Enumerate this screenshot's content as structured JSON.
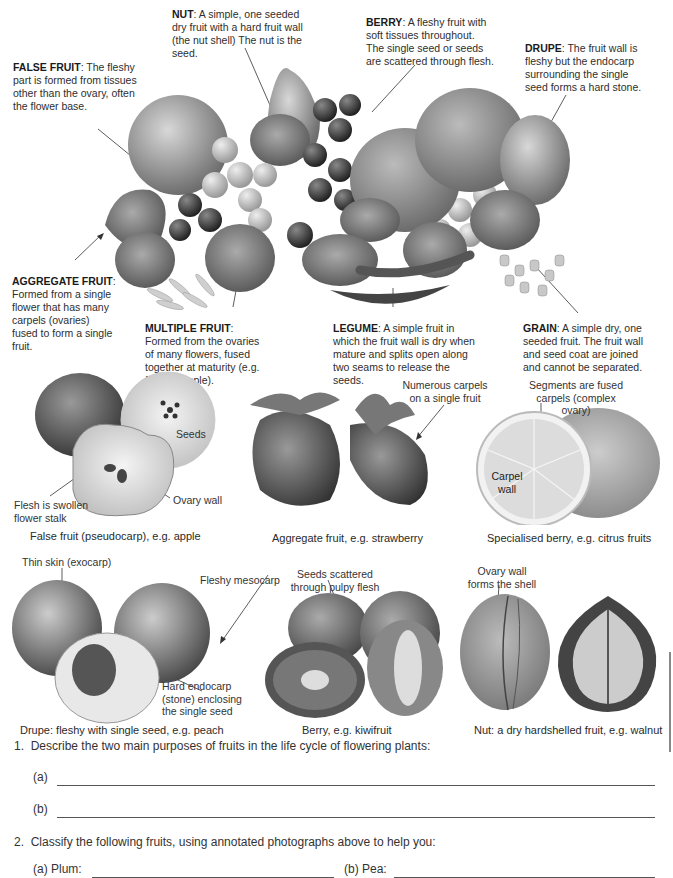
{
  "top_annotations": {
    "false_fruit": {
      "term": "FALSE FRUIT",
      "text": ": The fleshy part is formed from tissues other than the ovary, often the flower base."
    },
    "nut": {
      "term": "NUT",
      "text": ": A simple, one seeded dry fruit with a hard fruit wall (the nut shell) The nut is the seed."
    },
    "berry": {
      "term": "BERRY",
      "text": ": A fleshy fruit with soft tissues throughout. The single seed or seeds are scattered through flesh."
    },
    "drupe": {
      "term": "DRUPE",
      "text": ": The fruit wall is fleshy but the endocarp surrounding the single seed forms a hard stone."
    },
    "aggregate_fruit": {
      "term": "AGGREGATE FRUIT",
      "text": ": Formed from a single flower that has many carpels (ovaries) fused to form a single fruit."
    },
    "multiple_fruit": {
      "term": "MULTIPLE FRUIT",
      "text": ": Formed from the ovaries of many flowers, fused together at maturity (e.g. fig, pineapple)."
    },
    "legume": {
      "term": "LEGUME",
      "text": ": A simple fruit in which the fruit wall is dry when mature and splits open along two seams to release the seeds."
    },
    "grain": {
      "term": "GRAIN",
      "text": ": A simple dry, one seeded fruit. The fruit wall and seed coat are joined and cannot be separated."
    }
  },
  "photos": {
    "apple": {
      "labels": {
        "seeds": "Seeds",
        "flesh": "Flesh is swollen flower stalk",
        "ovary_wall": "Ovary wall"
      },
      "caption": "False fruit (pseudocarp), e.g. apple"
    },
    "strawberry": {
      "labels": {
        "carpels": "Numerous carpels on a single fruit"
      },
      "caption": "Aggregate fruit, e.g. strawberry"
    },
    "citrus": {
      "labels": {
        "segments": "Segments are fused carpels (complex ovary)",
        "carpel_wall": "Carpel wall"
      },
      "caption": "Specialised berry, e.g. citrus fruits"
    },
    "peach": {
      "labels": {
        "exocarp": "Thin skin (exocarp)",
        "mesocarp": "Fleshy mesocarp",
        "endocarp": "Hard endocarp (stone) enclosing the single seed"
      },
      "caption": "Drupe: fleshy with single seed, e.g. peach"
    },
    "kiwi": {
      "labels": {
        "seeds": "Seeds scattered through pulpy flesh"
      },
      "caption": "Berry, e.g. kiwifruit"
    },
    "walnut": {
      "labels": {
        "shell": "Ovary wall forms the shell"
      },
      "caption": "Nut: a dry hardshelled fruit, e.g. walnut"
    }
  },
  "questions": [
    {
      "number": "1.",
      "text": "Describe the two main purposes of fruits in the life cycle of flowering plants:",
      "parts": [
        {
          "label": "(a)",
          "value": ""
        },
        {
          "label": "(b)",
          "value": ""
        }
      ]
    },
    {
      "number": "2.",
      "text": "Classify the following fruits, using annotated photographs above to help you:",
      "parts": [
        {
          "label": "(a) Plum:",
          "value": ""
        },
        {
          "label": "(b) Pea:",
          "value": ""
        }
      ]
    }
  ]
}
